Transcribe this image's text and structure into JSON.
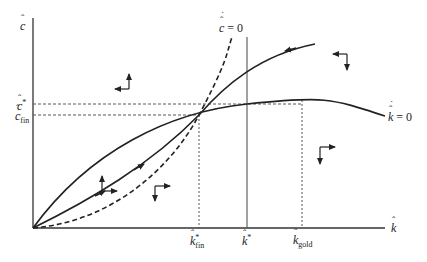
{
  "diagram": {
    "type": "phase-diagram",
    "axes": {
      "y_label": "c",
      "x_label": "k"
    },
    "loci": {
      "c_dot_zero": {
        "label_var": "c",
        "label_eq": "= 0",
        "style": "dashed"
      },
      "k_dot_zero": {
        "label_var": "k",
        "label_eq": "= 0",
        "style": "solid"
      }
    },
    "y_ticks": [
      {
        "var": "c",
        "sup": "*",
        "sub": ""
      },
      {
        "var": "c",
        "sup": "",
        "sub": "fin"
      }
    ],
    "x_ticks": [
      {
        "var": "k",
        "sup": "*",
        "sub": "fin"
      },
      {
        "var": "k",
        "sup": "*",
        "sub": ""
      },
      {
        "var": "k",
        "sup": "",
        "sub": "gold"
      }
    ],
    "reference_lines": [
      {
        "name": "c-star",
        "style": "dashed",
        "orientation": "horizontal"
      },
      {
        "name": "c-fin",
        "style": "dashed",
        "orientation": "horizontal"
      },
      {
        "name": "k-fin-star",
        "style": "dotted",
        "orientation": "vertical"
      },
      {
        "name": "k-star",
        "style": "solid",
        "orientation": "vertical"
      },
      {
        "name": "k-gold",
        "style": "dotted",
        "orientation": "vertical"
      }
    ],
    "direction_arrows": [
      {
        "region": "upper-left",
        "horizontal": "left",
        "vertical": "up"
      },
      {
        "region": "upper-right",
        "horizontal": "left",
        "vertical": "down"
      },
      {
        "region": "lower-left",
        "horizontal": "right",
        "vertical": "up"
      },
      {
        "region": "lower-middle",
        "horizontal": "right",
        "vertical": "down"
      },
      {
        "region": "lower-right",
        "horizontal": "right",
        "vertical": "down"
      }
    ],
    "trajectories": [
      {
        "name": "saddle-path-lower",
        "direction": "toward-steady-state"
      },
      {
        "name": "saddle-path-upper",
        "direction": "toward-steady-state"
      }
    ]
  }
}
